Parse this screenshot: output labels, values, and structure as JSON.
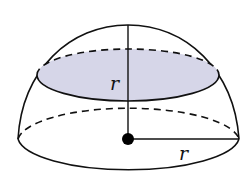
{
  "diagram": {
    "type": "hemisphere-cross-section",
    "labels": {
      "height_label": "r",
      "radius_label": "r"
    },
    "colors": {
      "stroke": "#111111",
      "shaded_section": "#d6d6e8",
      "center_point": "#000000",
      "background": "#ffffff"
    }
  }
}
